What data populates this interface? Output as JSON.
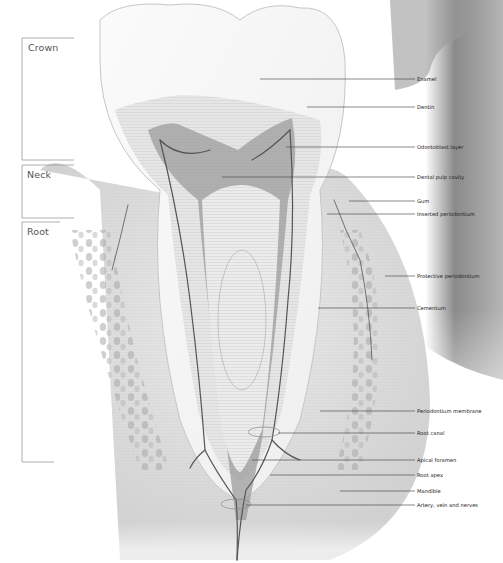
{
  "diagram": {
    "regions": [
      {
        "id": "crown",
        "label": "Crown"
      },
      {
        "id": "neck",
        "label": "Neck"
      },
      {
        "id": "root",
        "label": "Root"
      }
    ],
    "callouts": [
      {
        "id": "enamel",
        "label": "Enamel"
      },
      {
        "id": "dentin",
        "label": "Dentin"
      },
      {
        "id": "odontoblast-layer",
        "label": "Odontoblast layer"
      },
      {
        "id": "dental-pulp-cavity",
        "label": "Dental pulp cavity"
      },
      {
        "id": "gum",
        "label": "Gum"
      },
      {
        "id": "inserted-periodontium",
        "label": "Inserted periodontium"
      },
      {
        "id": "protective-periodontium",
        "label": "Protective periodontium"
      },
      {
        "id": "cementum",
        "label": "Cementum"
      },
      {
        "id": "periodontium-membrane",
        "label": "Periodontium membrane"
      },
      {
        "id": "root-canal",
        "label": "Root canal"
      },
      {
        "id": "apical-foramen",
        "label": "Apical foramen"
      },
      {
        "id": "root-apex",
        "label": "Root apex"
      },
      {
        "id": "mandible",
        "label": "Mandible"
      },
      {
        "id": "artery-vein-nerves",
        "label": "Artery, vein and nerves"
      }
    ]
  }
}
